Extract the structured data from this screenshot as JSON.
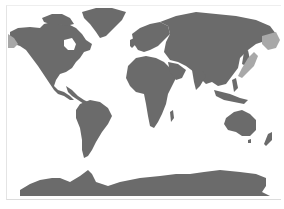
{
  "map": {
    "type": "world-map",
    "projection": "equirectangular",
    "colors": {
      "ocean": "#ffffff",
      "land": "#6b6b6b",
      "highlight": "#a8a8a8",
      "frame": "#dcdcdc"
    },
    "highlighted_regions": [
      "alaska-west",
      "kamchatka-east",
      "sea-of-okhotsk-coast",
      "japan-east-coast"
    ],
    "continents": [
      "north-america",
      "greenland",
      "south-america",
      "europe",
      "africa",
      "asia",
      "australia",
      "antarctica"
    ]
  }
}
